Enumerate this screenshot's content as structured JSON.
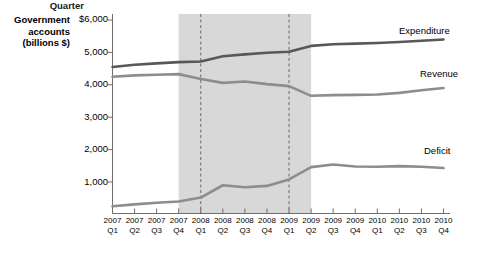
{
  "chart_data": {
    "type": "line",
    "title": "",
    "ylabel": "Government accounts (billions $)",
    "xlabel": "Quarter",
    "ylabel_lines": [
      "Government",
      "accounts",
      "(billions $)"
    ],
    "ylim": [
      0,
      6000
    ],
    "yticks": [
      1000,
      2000,
      3000,
      4000,
      5000,
      6000
    ],
    "ytick_labels": [
      "1,000",
      "2,000",
      "3,000",
      "4,000",
      "5,000",
      "$6,000"
    ],
    "grid": false,
    "legend_position": "right-inline",
    "categories": [
      "2007 Q1",
      "2007 Q2",
      "2007 Q3",
      "2007 Q4",
      "2008 Q1",
      "2008 Q2",
      "2008 Q3",
      "2008 Q4",
      "2009 Q1",
      "2009 Q2",
      "2009 Q3",
      "2009 Q4",
      "2010 Q1",
      "2010 Q2",
      "2010 Q3",
      "2010 Q4"
    ],
    "xtick_years": [
      "2007",
      "2007",
      "2007",
      "2007",
      "2008",
      "2008",
      "2008",
      "2008",
      "2009",
      "2009",
      "2009",
      "2009",
      "2010",
      "2010",
      "2010",
      "2010"
    ],
    "xtick_quarters": [
      "Q1",
      "Q2",
      "Q3",
      "Q4",
      "Q1",
      "Q2",
      "Q3",
      "Q4",
      "Q1",
      "Q2",
      "Q3",
      "Q4",
      "Q1",
      "Q2",
      "Q3",
      "Q4"
    ],
    "series": [
      {
        "name": "Expenditure",
        "color": "#58585a",
        "values": [
          4550,
          4620,
          4660,
          4700,
          4720,
          4880,
          4940,
          4990,
          5020,
          5200,
          5250,
          5270,
          5290,
          5320,
          5360,
          5400
        ]
      },
      {
        "name": "Revenue",
        "color": "#8d8d8f",
        "values": [
          4250,
          4290,
          4310,
          4330,
          4180,
          4060,
          4100,
          4020,
          3960,
          3660,
          3680,
          3690,
          3700,
          3750,
          3830,
          3900
        ]
      },
      {
        "name": "Deficit",
        "color": "#8d8d8f",
        "values": [
          250,
          310,
          360,
          400,
          520,
          900,
          840,
          880,
          1080,
          1460,
          1540,
          1480,
          1470,
          1490,
          1470,
          1430
        ]
      }
    ],
    "shaded_region": {
      "label": "",
      "color": "#d8d8d8",
      "start_category": "2007 Q4",
      "end_category": "2009 Q2"
    },
    "marker_lines": [
      {
        "category": "2008 Q1",
        "style": "dashed"
      },
      {
        "category": "2009 Q1",
        "style": "dashed"
      }
    ]
  }
}
